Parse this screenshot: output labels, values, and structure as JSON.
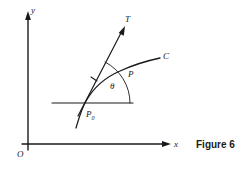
{
  "figure": {
    "caption": "Figure 6",
    "background_color": "#ffffff",
    "ink_color": "#1a1a1a",
    "axes": {
      "y_label": "y",
      "x_label": "x",
      "origin_label": "O"
    },
    "labels": {
      "tangent": "T",
      "curve": "C",
      "point_on_curve": "P",
      "tangent_point_base": "P",
      "tangent_point_subscript": "0",
      "angle": "θ"
    },
    "geometry": {
      "y_axis": {
        "x": 28,
        "y_top": 13,
        "y_bottom": 150
      },
      "x_axis": {
        "y": 144,
        "x_left": 22,
        "x_right": 170
      },
      "reference_line": {
        "y": 103,
        "x_left": 52,
        "x_right": 133
      },
      "tangent_point": {
        "x": 84,
        "y": 105
      },
      "tangent_tip": {
        "x": 124,
        "y": 28
      },
      "angle_arc_radius": 46,
      "angle_degrees": 62
    }
  }
}
